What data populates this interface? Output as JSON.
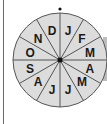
{
  "diagram": {
    "type": "month-wheel",
    "center": {
      "x": 60,
      "y": 60
    },
    "radius": 47,
    "label_radius": 31,
    "segment_count": 12,
    "fill_color": "#dcdcdc",
    "line_color": "#555555",
    "pointer_dot": {
      "x": 60,
      "y": 9
    },
    "segments": [
      {
        "label": "J",
        "month": "January"
      },
      {
        "label": "F",
        "month": "February"
      },
      {
        "label": "M",
        "month": "March"
      },
      {
        "label": "A",
        "month": "April"
      },
      {
        "label": "M",
        "month": "May"
      },
      {
        "label": "J",
        "month": "June"
      },
      {
        "label": "J",
        "month": "July"
      },
      {
        "label": "A",
        "month": "August"
      },
      {
        "label": "S",
        "month": "September"
      },
      {
        "label": "O",
        "month": "October"
      },
      {
        "label": "N",
        "month": "November"
      },
      {
        "label": "D",
        "month": "December"
      }
    ]
  }
}
